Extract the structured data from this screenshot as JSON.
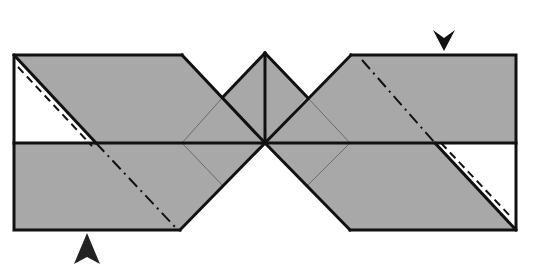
{
  "diagram": {
    "type": "origami fold diagram",
    "paper_color": "#a8a8a8",
    "line_color": "#111111",
    "background_color": "#ffffff",
    "marks": {
      "valley_fold_line": "dashed",
      "mountain_fold_line": "dash-dot",
      "crease_line": "thin"
    },
    "arrows": [
      {
        "name": "top-right-arrow",
        "direction": "down",
        "tip": [
          444,
          51
        ]
      },
      {
        "name": "bottom-left-arrow",
        "direction": "up",
        "tip": [
          87,
          233
        ]
      }
    ]
  },
  "caption": {
    "text": ""
  }
}
